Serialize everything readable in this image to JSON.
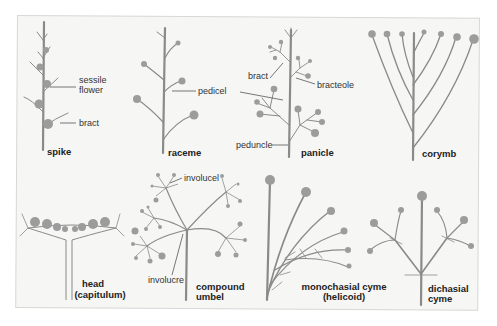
{
  "figure": {
    "colors": {
      "background": "#f6f6f5",
      "stem": "#8a8a8a",
      "flower": "#9c9c9c",
      "text": "#222222"
    },
    "types": [
      {
        "name": "spike",
        "labels": [
          "sessile flower",
          "bract"
        ]
      },
      {
        "name": "raceme",
        "labels": [
          "pedicel"
        ]
      },
      {
        "name": "panicle",
        "labels": [
          "bract",
          "bracteole",
          "peduncle"
        ]
      },
      {
        "name": "corymb",
        "labels": []
      },
      {
        "name": "head (capitulum)",
        "labels": []
      },
      {
        "name": "compound umbel",
        "labels": [
          "involucel",
          "involucre"
        ]
      },
      {
        "name": "monochasial cyme (helicoid)",
        "labels": []
      },
      {
        "name": "dichasial cyme",
        "labels": []
      }
    ]
  },
  "labels": {
    "spike": "spike",
    "sessile1": "sessile",
    "sessile2": "flower",
    "bract_spike": "bract",
    "raceme": "raceme",
    "pedicel": "pedicel",
    "panicle": "panicle",
    "bract_panicle": "bract",
    "bracteole": "bracteole",
    "peduncle": "peduncle",
    "corymb": "corymb",
    "head1": "head",
    "head2": "(capitulum)",
    "umbel1": "compound",
    "umbel2": "umbel",
    "involucel": "involucel",
    "involucre": "involucre",
    "mono1": "monochasial cyme",
    "mono2": "(helicoid)",
    "di1": "dichasial",
    "di2": "cyme"
  }
}
